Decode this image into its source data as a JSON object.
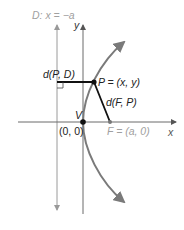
{
  "labels": {
    "directrix": "D: x = −a",
    "y_axis": "y",
    "x_axis": "x",
    "d_PD": "d(P, D)",
    "point_P": "P = (x, y)",
    "d_FP": "d(F, P)",
    "vertex": "V",
    "origin": "(0, 0)",
    "focus": "F = (a, 0)"
  },
  "colors": {
    "axis": "#6b6b6b",
    "directrix": "#9a9a9a",
    "parabola": "#7a7a7a",
    "segments": "#111111",
    "light_label": "#a0a0a0",
    "dark_label": "#222222"
  }
}
